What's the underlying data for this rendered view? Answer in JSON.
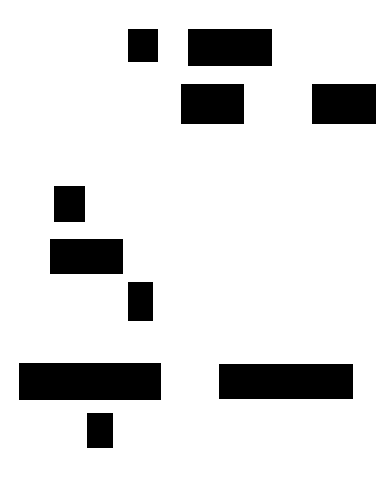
{
  "canvas": {
    "width": 392,
    "height": 481,
    "background_color": "#ffffff",
    "shape_color": "#000000",
    "title": "Abstract Black Rectangles Composition"
  },
  "shapes": [
    {
      "id": "rect-1",
      "name": "block-top-small-square",
      "x": 128,
      "y": 29,
      "width": 30,
      "height": 33,
      "color": "#000000"
    },
    {
      "id": "rect-2",
      "name": "block-top-wide-bar",
      "x": 188,
      "y": 29,
      "width": 84,
      "height": 37,
      "color": "#000000"
    },
    {
      "id": "rect-3",
      "name": "block-upper-center",
      "x": 181,
      "y": 84,
      "width": 63,
      "height": 40,
      "color": "#000000"
    },
    {
      "id": "rect-4",
      "name": "block-upper-right",
      "x": 312,
      "y": 84,
      "width": 64,
      "height": 40,
      "color": "#000000"
    },
    {
      "id": "rect-5",
      "name": "block-middle-left-tall",
      "x": 54,
      "y": 186,
      "width": 31,
      "height": 36,
      "color": "#000000"
    },
    {
      "id": "rect-6",
      "name": "block-middle-left-wide",
      "x": 50,
      "y": 239,
      "width": 73,
      "height": 35,
      "color": "#000000"
    },
    {
      "id": "rect-7",
      "name": "block-middle-center-narrow",
      "x": 128,
      "y": 282,
      "width": 25,
      "height": 39,
      "color": "#000000"
    },
    {
      "id": "rect-8",
      "name": "block-bottom-left-long-bar",
      "x": 19,
      "y": 363,
      "width": 142,
      "height": 37,
      "color": "#000000"
    },
    {
      "id": "rect-9",
      "name": "block-bottom-right-long-bar",
      "x": 219,
      "y": 364,
      "width": 134,
      "height": 35,
      "color": "#000000"
    },
    {
      "id": "rect-10",
      "name": "block-bottom-small-vertical",
      "x": 87,
      "y": 413,
      "width": 26,
      "height": 35,
      "color": "#000000"
    }
  ]
}
